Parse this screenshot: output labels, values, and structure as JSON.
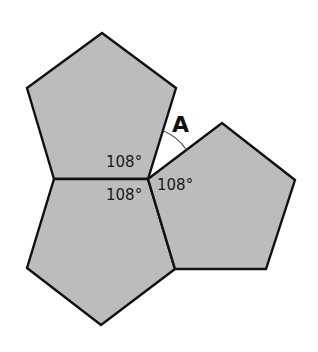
{
  "diagram": {
    "colors": {
      "background": "#ffffff",
      "pentagon_fill": "#bcbcbc",
      "stroke": "#111111",
      "arc": "#555555"
    },
    "pentagons": [
      {
        "name": "top-pentagon",
        "points": "54,179 27,88 102,33 176,88 148,179"
      },
      {
        "name": "bottom-pentagon",
        "points": "54,179 148,179 175,269 101,325 27,268"
      },
      {
        "name": "right-pentagon",
        "points": "148,179 222,123 295,180 266,269 175,269"
      }
    ],
    "labels": {
      "angle_top_left": "108°",
      "angle_bottom_left": "108°",
      "angle_right": "108°",
      "unknown_angle": "A"
    }
  }
}
